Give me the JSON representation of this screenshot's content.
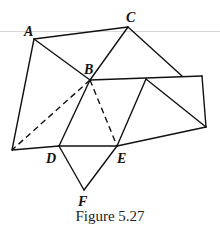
{
  "figure": {
    "caption": "Figure 5.27",
    "points": {
      "A": {
        "label": "A",
        "x": 34,
        "y": 39
      },
      "C": {
        "label": "C",
        "x": 128,
        "y": 27
      },
      "B": {
        "label": "B",
        "x": 90,
        "y": 80
      },
      "D": {
        "label": "D",
        "x": 59,
        "y": 146
      },
      "E": {
        "label": "E",
        "x": 117,
        "y": 146
      },
      "F": {
        "label": "F",
        "x": 84,
        "y": 190
      }
    },
    "stroke_color": "#111111",
    "solid_segments": [
      "A-C",
      "A-B",
      "A-P",
      "C-B",
      "C-R",
      "B-S",
      "S-T",
      "T-E",
      "P-D",
      "D-E",
      "E-T",
      "D-F",
      "F-E",
      "B-D",
      "G-E",
      "G-T"
    ],
    "dashed_segments": [
      "B-P",
      "B-E"
    ]
  }
}
